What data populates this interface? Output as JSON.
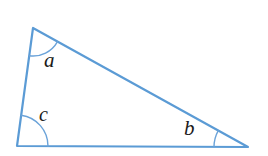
{
  "figure": {
    "type": "geometry-diagram",
    "shape": "triangle",
    "background_color": "#ffffff",
    "stroke_color": "#5b9bd5",
    "arc_color": "#6ba3d9",
    "label_color": "#1a1a1a",
    "stroke_width": 2.2,
    "arc_width": 1.4,
    "vertices": [
      {
        "name": "apex",
        "x": 33,
        "y": 28
      },
      {
        "name": "bottom-left",
        "x": 17,
        "y": 146
      },
      {
        "name": "bottom-right",
        "x": 248,
        "y": 147
      }
    ],
    "edges": [
      {
        "name": "left-side",
        "from": "apex",
        "to": "bottom-left"
      },
      {
        "name": "base",
        "from": "bottom-left",
        "to": "bottom-right"
      },
      {
        "name": "hypotenuse",
        "from": "apex",
        "to": "bottom-right"
      }
    ],
    "angles": [
      {
        "id": "a",
        "label": "a",
        "vertex": "apex",
        "arc_radius": 28,
        "label_x": 44,
        "label_y": 50,
        "font_size": 21
      },
      {
        "id": "c",
        "label": "c",
        "vertex": "bottom-left",
        "arc_radius": 31,
        "label_x": 39,
        "label_y": 104,
        "font_size": 20
      },
      {
        "id": "b",
        "label": "b",
        "vertex": "bottom-right",
        "arc_radius": 34,
        "label_x": 184,
        "label_y": 118,
        "font_size": 21
      }
    ]
  }
}
